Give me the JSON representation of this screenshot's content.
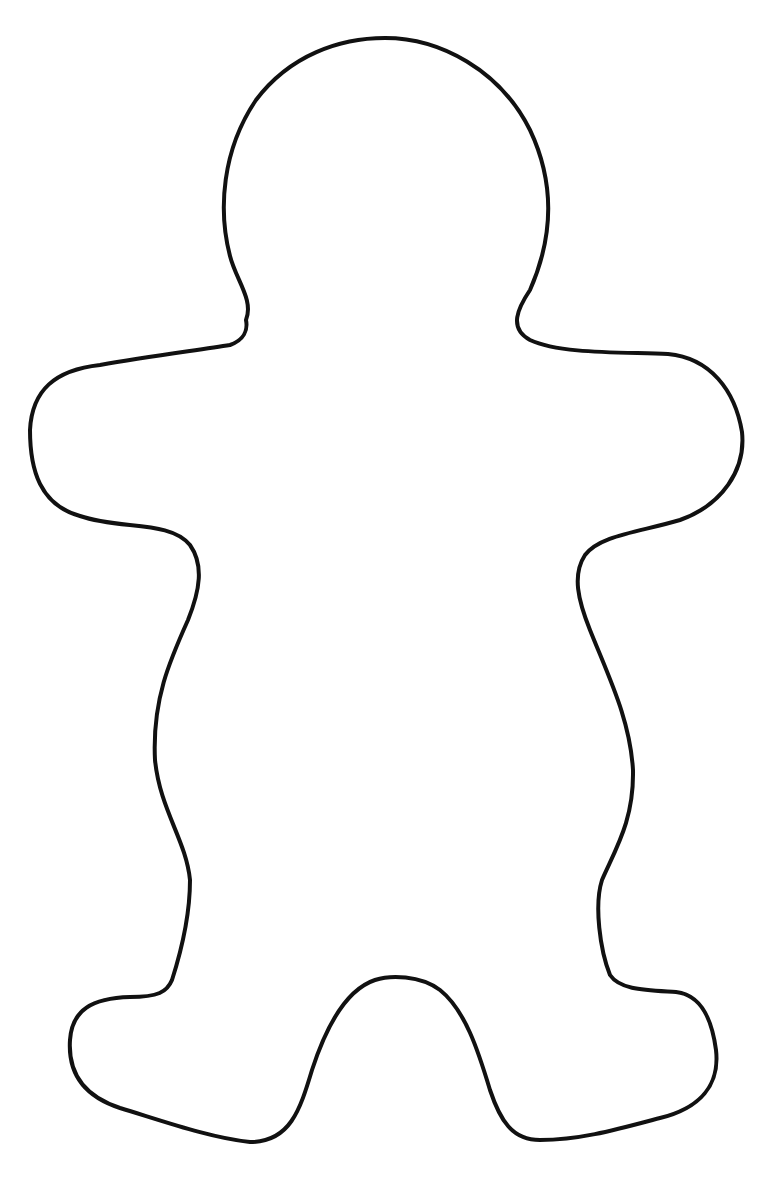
{
  "figure": {
    "stroke_color": "#111111",
    "fill_color": "#ffffff",
    "background_color": "#ffffff"
  }
}
